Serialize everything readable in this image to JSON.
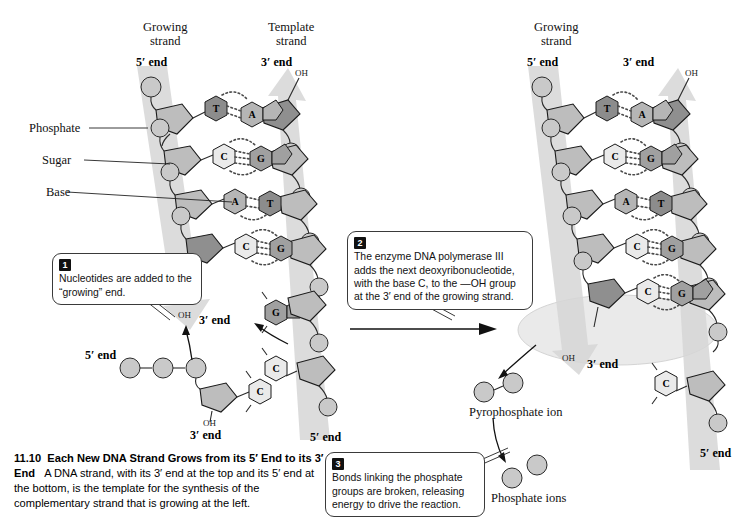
{
  "figure": {
    "number": "11.10",
    "title": "Each New DNA Strand Grows from its 5′ End to its 3′ End",
    "body": "A DNA strand, with its 3′ end at the top and its 5′ end at the bottom, is the template for the synthesis of the complementary strand that is growing at the left."
  },
  "left_panel": {
    "growing_strand_label": "Growing\nstrand",
    "template_strand_label": "Template\nstrand",
    "growing_five_prime": "5′ end",
    "template_three_prime": "3′ end",
    "template_oh": "OH",
    "growing_three_prime": "3′ end",
    "growing_oh": "OH",
    "template_five_prime": "5′ end",
    "part_labels": [
      {
        "name": "phosphate",
        "text": "Phosphate"
      },
      {
        "name": "sugar",
        "text": "Sugar"
      },
      {
        "name": "base",
        "text": "Base"
      }
    ],
    "base_pairs": [
      {
        "growing": "T",
        "template": "A"
      },
      {
        "growing": "C",
        "template": "G"
      },
      {
        "growing": "A",
        "template": "T"
      },
      {
        "growing": "C",
        "template": "G"
      }
    ],
    "free_nucleotide": {
      "five_prime": "5′ end",
      "three_prime": "3′ end",
      "oh": "OH",
      "base": "C",
      "phosphate_count": 3
    },
    "template_next_base": "C",
    "incoming_base": "G"
  },
  "right_panel": {
    "growing_strand_label": "Growing\nstrand",
    "growing_five_prime": "5′ end",
    "template_three_prime": "3′ end",
    "template_oh": "OH",
    "growing_three_prime": "3′ end",
    "growing_oh": "OH",
    "template_five_prime": "5′ end",
    "base_pairs": [
      {
        "growing": "T",
        "template": "A"
      },
      {
        "growing": "C",
        "template": "G"
      },
      {
        "growing": "A",
        "template": "T"
      },
      {
        "growing": "C",
        "template": "G"
      },
      {
        "growing": "C",
        "template": "G"
      }
    ],
    "template_next_base": "C",
    "pyrophosphate_label": "Pyrophosphate ion",
    "phosphate_ions_label": "Phosphate ions"
  },
  "callouts": [
    {
      "num": "1",
      "text": "Nucleotides are added to the “growing” end."
    },
    {
      "num": "2",
      "text": "The enzyme DNA polymerase III adds the next deoxyribonucleotide, with the base C, to the —OH group at the 3′ end of the growing strand."
    },
    {
      "num": "3",
      "text": "Bonds linking the phosphate groups are broken, releasing energy to drive the reaction."
    }
  ],
  "colors": {
    "background": "#ffffff",
    "ribbon": "#d6d6d6",
    "sugar": "#bdbdbd",
    "phosphate": "#c9c9c9",
    "base_T": "#8c8c8c",
    "base_A": "#b5b5b5",
    "base_C": "#eaeaea",
    "base_G": "#a0a0a0",
    "highlight_ellipse": "#e8e8e8",
    "outline": "#1a1a1a"
  }
}
